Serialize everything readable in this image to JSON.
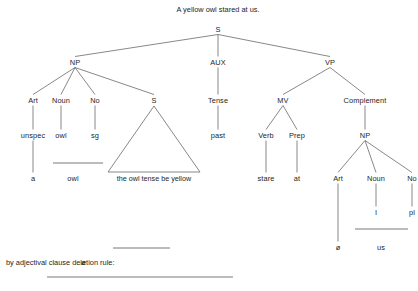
{
  "title": {
    "text": "A yellow owl stared at us.",
    "x": 218,
    "y": 9
  },
  "colors": {
    "ink": "#252525",
    "line": "#6a6a6a",
    "background": "#ffffff"
  },
  "chart_data": {
    "type": "diagram",
    "diagram_kind": "syntactic-phrase-structure-tree",
    "title": "A yellow owl stared at us.",
    "nodes": [
      {
        "id": "S",
        "label": "S",
        "x": 218,
        "y": 29,
        "level": 0
      },
      {
        "id": "NP1",
        "label": "NP",
        "x": 75,
        "y": 62,
        "level": 1
      },
      {
        "id": "AUX",
        "label": "AUX",
        "x": 218,
        "y": 62,
        "level": 1
      },
      {
        "id": "VP",
        "label": "VP",
        "x": 330,
        "y": 62,
        "level": 1
      },
      {
        "id": "Art1",
        "label": "Art",
        "x": 33,
        "y": 100,
        "level": 2
      },
      {
        "id": "Noun1",
        "label": "Noun",
        "x": 61,
        "y": 100,
        "level": 2
      },
      {
        "id": "No1",
        "label": "No",
        "x": 95,
        "y": 100,
        "level": 2
      },
      {
        "id": "S2",
        "label": "S",
        "x": 154,
        "y": 100,
        "level": 2
      },
      {
        "id": "Tense",
        "label": "Tense",
        "x": 218,
        "y": 100,
        "level": 2
      },
      {
        "id": "MV",
        "label": "MV",
        "x": 283,
        "y": 100,
        "level": 2
      },
      {
        "id": "Complement",
        "label": "Complement",
        "x": 365,
        "y": 100,
        "level": 2
      },
      {
        "id": "unspec",
        "label": "unspec",
        "x": 33,
        "y": 135,
        "level": 3
      },
      {
        "id": "owl_pre",
        "label": "owl",
        "x": 61,
        "y": 135,
        "level": 3
      },
      {
        "id": "sg",
        "label": "sg",
        "x": 95,
        "y": 135,
        "level": 3
      },
      {
        "id": "past",
        "label": "past",
        "x": 218,
        "y": 135,
        "level": 3
      },
      {
        "id": "Verb",
        "label": "Verb",
        "x": 266,
        "y": 135,
        "level": 3
      },
      {
        "id": "Prep",
        "label": "Prep",
        "x": 297,
        "y": 135,
        "level": 3
      },
      {
        "id": "NP2",
        "label": "NP",
        "x": 365,
        "y": 135,
        "level": 3
      },
      {
        "id": "a",
        "label": "a",
        "x": 33,
        "y": 178,
        "level": 4
      },
      {
        "id": "owl_term",
        "label": "owl",
        "x": 73,
        "y": 178,
        "level": 4
      },
      {
        "id": "stare",
        "label": "stare",
        "x": 266,
        "y": 178,
        "level": 4
      },
      {
        "id": "at",
        "label": "at",
        "x": 297,
        "y": 178,
        "level": 4
      },
      {
        "id": "Art2",
        "label": "Art",
        "x": 338,
        "y": 178,
        "level": 4
      },
      {
        "id": "Noun2",
        "label": "Noun",
        "x": 376,
        "y": 178,
        "level": 4
      },
      {
        "id": "No2",
        "label": "No",
        "x": 412,
        "y": 178,
        "level": 4
      },
      {
        "id": "I",
        "label": "I",
        "x": 376,
        "y": 212,
        "level": 5
      },
      {
        "id": "pl",
        "label": "pl",
        "x": 412,
        "y": 212,
        "level": 5
      },
      {
        "id": "zero_art",
        "label": "ø",
        "x": 338,
        "y": 247,
        "level": 6
      },
      {
        "id": "us",
        "label": "us",
        "x": 381,
        "y": 247,
        "level": 6
      }
    ],
    "edges": [
      [
        "S",
        "NP1"
      ],
      [
        "S",
        "AUX"
      ],
      [
        "S",
        "VP"
      ],
      [
        "NP1",
        "Art1"
      ],
      [
        "NP1",
        "Noun1"
      ],
      [
        "NP1",
        "No1"
      ],
      [
        "NP1",
        "S2"
      ],
      [
        "AUX",
        "Tense"
      ],
      [
        "VP",
        "MV"
      ],
      [
        "VP",
        "Complement"
      ],
      [
        "Art1",
        "unspec"
      ],
      [
        "Noun1",
        "owl_pre"
      ],
      [
        "No1",
        "sg"
      ],
      [
        "Tense",
        "past"
      ],
      [
        "MV",
        "Verb"
      ],
      [
        "MV",
        "Prep"
      ],
      [
        "Complement",
        "NP2"
      ],
      [
        "unspec",
        "a"
      ],
      [
        "Verb",
        "stare"
      ],
      [
        "Prep",
        "at"
      ],
      [
        "NP2",
        "Art2"
      ],
      [
        "NP2",
        "Noun2"
      ],
      [
        "NP2",
        "No2"
      ],
      [
        "Noun2",
        "I"
      ],
      [
        "No2",
        "pl"
      ],
      [
        "Art2",
        "zero_art"
      ]
    ],
    "triangle": {
      "parent": "S2",
      "apex_x": 154,
      "apex_y": 106,
      "base_left_x": 108,
      "base_right_x": 200,
      "base_y": 172,
      "text": "the owl  tense  be yellow",
      "text_x": 154,
      "text_y": 178
    },
    "rule_bars": [
      {
        "name": "owl-merge-bar",
        "x1": 53,
        "x2": 103,
        "y": 163
      },
      {
        "name": "us-merge-bar",
        "x1": 355,
        "x2": 408,
        "y": 229
      },
      {
        "name": "deletion-short-bar",
        "x1": 113,
        "x2": 170,
        "y": 248
      },
      {
        "name": "deletion-long-bar",
        "x1": 47,
        "x2": 233,
        "y": 277
      }
    ]
  },
  "footnote": {
    "label": "by adjectival clause deletion rule:",
    "label_x": 6,
    "label_y": 262,
    "value": "ø",
    "value_x": 81,
    "value_y": 262
  }
}
